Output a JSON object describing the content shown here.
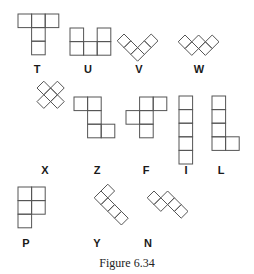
{
  "figure": {
    "caption": "Figure 6.34",
    "stroke_color": "#555555",
    "label_color": "#1a1a1a",
    "cell_size": 13.6,
    "diamond_half_diagonal": 6.8
  },
  "pentominoes": [
    {
      "name": "T",
      "label": "T",
      "orientation": "axis",
      "origin": [
        18,
        14
      ],
      "cells": [
        [
          0,
          0
        ],
        [
          1,
          0
        ],
        [
          2,
          0
        ],
        [
          1,
          1
        ],
        [
          1,
          2
        ]
      ],
      "label_pos": [
        37,
        64
      ]
    },
    {
      "name": "U",
      "label": "U",
      "orientation": "axis",
      "origin": [
        70,
        28
      ],
      "cells": [
        [
          0,
          0
        ],
        [
          2,
          0
        ],
        [
          0,
          1
        ],
        [
          1,
          1
        ],
        [
          2,
          1
        ]
      ],
      "label_pos": [
        88,
        64
      ]
    },
    {
      "name": "V",
      "label": "V",
      "orientation": "diamond",
      "origin": [
        124,
        34
      ],
      "cells": [
        [
          0,
          0
        ],
        [
          0,
          1
        ],
        [
          0,
          2
        ],
        [
          1,
          2
        ],
        [
          2,
          2
        ]
      ],
      "label_pos": [
        139,
        64
      ]
    },
    {
      "name": "W",
      "label": "W",
      "orientation": "diamond",
      "origin": [
        185,
        35
      ],
      "cells": [
        [
          0,
          0
        ],
        [
          0,
          1
        ],
        [
          1,
          1
        ],
        [
          1,
          2
        ],
        [
          2,
          2
        ]
      ],
      "label_pos": [
        199,
        64
      ]
    },
    {
      "name": "X",
      "label": "X",
      "orientation": "diamond",
      "origin": [
        37,
        88
      ],
      "cells": [
        [
          1,
          0
        ],
        [
          0,
          1
        ],
        [
          1,
          1
        ],
        [
          2,
          1
        ],
        [
          1,
          2
        ]
      ],
      "label_pos": [
        45,
        165
      ]
    },
    {
      "name": "Z",
      "label": "Z",
      "orientation": "axis",
      "origin": [
        74,
        97
      ],
      "cells": [
        [
          0,
          0
        ],
        [
          1,
          0
        ],
        [
          1,
          1
        ],
        [
          1,
          2
        ],
        [
          2,
          2
        ]
      ],
      "label_pos": [
        97,
        165
      ]
    },
    {
      "name": "F",
      "label": "F",
      "orientation": "axis",
      "origin": [
        126,
        97
      ],
      "cells": [
        [
          1,
          0
        ],
        [
          2,
          0
        ],
        [
          0,
          1
        ],
        [
          1,
          1
        ],
        [
          1,
          2
        ]
      ],
      "label_pos": [
        146,
        165
      ]
    },
    {
      "name": "I",
      "label": "I",
      "orientation": "axis",
      "origin": [
        179,
        96
      ],
      "cells": [
        [
          0,
          0
        ],
        [
          0,
          1
        ],
        [
          0,
          2
        ],
        [
          0,
          3
        ],
        [
          0,
          4
        ]
      ],
      "label_pos": [
        186,
        165
      ]
    },
    {
      "name": "L",
      "label": "L",
      "orientation": "axis",
      "origin": [
        212,
        96
      ],
      "cells": [
        [
          0,
          0
        ],
        [
          0,
          1
        ],
        [
          0,
          2
        ],
        [
          0,
          3
        ],
        [
          1,
          3
        ]
      ],
      "label_pos": [
        221,
        165
      ]
    },
    {
      "name": "P",
      "label": "P",
      "orientation": "axis",
      "origin": [
        18,
        187
      ],
      "cells": [
        [
          0,
          0
        ],
        [
          1,
          0
        ],
        [
          0,
          1
        ],
        [
          1,
          1
        ],
        [
          0,
          2
        ]
      ],
      "label_pos": [
        26,
        238
      ]
    },
    {
      "name": "Y",
      "label": "Y",
      "orientation": "diamond",
      "origin": [
        101,
        191
      ],
      "cells": [
        [
          0,
          0
        ],
        [
          1,
          0
        ],
        [
          0,
          1
        ],
        [
          0,
          2
        ],
        [
          0,
          3
        ]
      ],
      "label_pos": [
        97,
        238
      ]
    },
    {
      "name": "N",
      "label": "N",
      "orientation": "diamond",
      "origin": [
        154,
        191
      ],
      "cells": [
        [
          0,
          0
        ],
        [
          0,
          1
        ],
        [
          1,
          1
        ],
        [
          1,
          2
        ],
        [
          1,
          3
        ]
      ],
      "label_pos": [
        148,
        238
      ]
    }
  ]
}
